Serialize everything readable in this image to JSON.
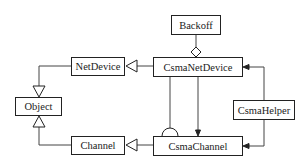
{
  "diagram": {
    "type": "UML class diagram",
    "classes": {
      "backoff": "Backoff",
      "csma_net_device": "CsmaNetDevice",
      "net_device": "NetDevice",
      "object": "Object",
      "channel": "Channel",
      "csma_channel": "CsmaChannel",
      "csma_helper": "CsmaHelper"
    },
    "relations": [
      {
        "from": "CsmaNetDevice",
        "to": "NetDevice",
        "type": "inheritance"
      },
      {
        "from": "NetDevice",
        "to": "Object",
        "type": "inheritance"
      },
      {
        "from": "Channel",
        "to": "Object",
        "type": "inheritance"
      },
      {
        "from": "CsmaChannel",
        "to": "Channel",
        "type": "inheritance"
      },
      {
        "from": "CsmaNetDevice",
        "to": "Backoff",
        "type": "aggregation"
      },
      {
        "from": "CsmaNetDevice",
        "to": "CsmaChannel",
        "type": "association"
      },
      {
        "from": "CsmaNetDevice",
        "to": "CsmaChannel",
        "type": "socket/required-interface"
      },
      {
        "from": "CsmaHelper",
        "to": "CsmaNetDevice",
        "type": "association"
      },
      {
        "from": "CsmaHelper",
        "to": "CsmaChannel",
        "type": "association"
      }
    ]
  }
}
